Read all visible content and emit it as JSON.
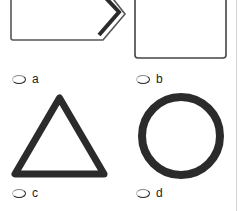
{
  "question": {
    "options": [
      {
        "id": "a",
        "label": "a",
        "shape": "pentagon-arrow-icon",
        "selected": false
      },
      {
        "id": "b",
        "label": "b",
        "shape": "square-icon",
        "selected": false
      },
      {
        "id": "c",
        "label": "c",
        "shape": "triangle-icon",
        "selected": false
      },
      {
        "id": "d",
        "label": "d",
        "shape": "circle-icon",
        "selected": false
      }
    ]
  },
  "colors": {
    "shape_stroke": "#2b2b2b",
    "divider": "#d4d4d4",
    "background": "#ffffff"
  }
}
